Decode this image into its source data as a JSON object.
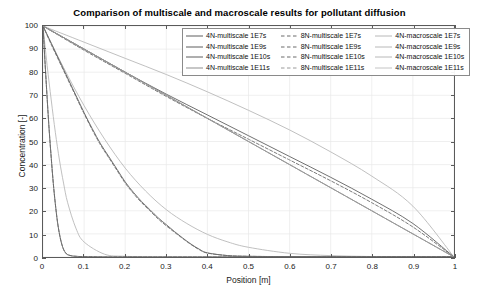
{
  "chart_data": {
    "type": "line",
    "title": "Comparison of multiscale and macroscale results for pollutant diffusion",
    "xlabel": "Position [m]",
    "ylabel": "Concentration [-]",
    "xlim": [
      0,
      1
    ],
    "ylim": [
      0,
      100
    ],
    "xticks": [
      "0",
      "0.1",
      "0.2",
      "0.3",
      "0.4",
      "0.5",
      "0.6",
      "0.7",
      "0.8",
      "0.9",
      "1"
    ],
    "xtick_values": [
      0,
      0.1,
      0.2,
      0.3,
      0.4,
      0.5,
      0.6,
      0.7,
      0.8,
      0.9,
      1
    ],
    "yticks": [
      "0",
      "10",
      "20",
      "30",
      "40",
      "50",
      "60",
      "70",
      "80",
      "90",
      "100"
    ],
    "ytick_values": [
      0,
      10,
      20,
      30,
      40,
      50,
      60,
      70,
      80,
      90,
      100
    ],
    "grid": true,
    "legend_position": "top-right",
    "legend_columns": 3,
    "series": [
      {
        "name": "4N-multiscale 1E7s",
        "style": "solid",
        "color": "#5f5f5f",
        "x": [
          0,
          0.005,
          0.01,
          0.015,
          0.02,
          0.025,
          0.03,
          0.035,
          0.04,
          0.045,
          0.05,
          0.055,
          0.06,
          0.07,
          0.08,
          0.1,
          0.15,
          0.2,
          0.3,
          0.4,
          0.5,
          0.6,
          0.7,
          0.8,
          0.9,
          1
        ],
        "values": [
          100,
          84,
          69,
          55,
          43,
          32,
          23,
          15.5,
          10,
          6,
          3.3,
          1.8,
          1.0,
          0.5,
          0.3,
          0.15,
          0.05,
          0.02,
          0.01,
          0.0,
          0.0,
          0.0,
          0.0,
          0.0,
          0.0,
          0.0
        ]
      },
      {
        "name": "8N-multiscale 1E7s",
        "style": "dashed",
        "color": "#6b6b6b",
        "x": [
          0,
          0.005,
          0.01,
          0.015,
          0.02,
          0.025,
          0.03,
          0.035,
          0.04,
          0.045,
          0.05,
          0.055,
          0.06,
          0.07,
          0.08,
          0.1,
          0.15,
          0.2,
          0.3,
          0.4,
          0.5,
          0.6,
          0.7,
          0.8,
          0.9,
          1
        ],
        "values": [
          100,
          84,
          69,
          55,
          43,
          32,
          23,
          15.5,
          10,
          6,
          3.3,
          1.8,
          1.0,
          0.5,
          0.3,
          0.15,
          0.05,
          0.02,
          0.01,
          0.0,
          0.0,
          0.0,
          0.0,
          0.0,
          0.0,
          0.0
        ]
      },
      {
        "name": "4N-macroscale 1E7s",
        "style": "solid",
        "color": "#b8b8b8",
        "x": [
          0,
          0.01,
          0.02,
          0.03,
          0.04,
          0.05,
          0.06,
          0.08,
          0.1,
          0.15,
          0.2,
          0.3,
          0.4,
          0.5,
          0.6,
          0.8,
          1
        ],
        "values": [
          100,
          83,
          68,
          54,
          42,
          32,
          23.5,
          12.5,
          6.5,
          1.2,
          0.3,
          0.02,
          0.0,
          0.0,
          0.0,
          0.0,
          0.0
        ]
      },
      {
        "name": "4N-multiscale 1E9s",
        "style": "solid",
        "color": "#5f5f5f",
        "x": [
          0,
          0.02,
          0.04,
          0.06,
          0.08,
          0.1,
          0.12,
          0.14,
          0.16,
          0.18,
          0.2,
          0.22,
          0.24,
          0.26,
          0.28,
          0.3,
          0.32,
          0.34,
          0.36,
          0.38,
          0.4,
          0.45,
          0.5,
          0.6,
          0.7,
          0.8,
          0.9,
          1
        ],
        "values": [
          100,
          92.5,
          85,
          77.5,
          70,
          62.5,
          55.5,
          49,
          43.5,
          38,
          32.5,
          28,
          24,
          20.5,
          17,
          14,
          11,
          8.2,
          5.6,
          3.4,
          1.8,
          0.6,
          0.3,
          0.15,
          0.08,
          0.04,
          0.02,
          0.0
        ]
      },
      {
        "name": "8N-multiscale 1E9s",
        "style": "dashed",
        "color": "#6b6b6b",
        "x": [
          0,
          0.02,
          0.04,
          0.06,
          0.08,
          0.1,
          0.12,
          0.14,
          0.16,
          0.18,
          0.2,
          0.22,
          0.24,
          0.26,
          0.28,
          0.3,
          0.32,
          0.34,
          0.36,
          0.38,
          0.4,
          0.45,
          0.5,
          0.6,
          0.7,
          0.8,
          0.9,
          1
        ],
        "values": [
          100,
          92,
          84.5,
          77,
          69.5,
          62,
          55,
          48.5,
          43,
          37.5,
          32,
          27.5,
          23.5,
          20,
          16.5,
          13.5,
          10.7,
          8.0,
          5.4,
          3.2,
          1.7,
          0.6,
          0.3,
          0.15,
          0.08,
          0.04,
          0.02,
          0.0
        ]
      },
      {
        "name": "4N-macroscale 1E9s",
        "style": "solid",
        "color": "#b8b8b8",
        "x": [
          0,
          0.05,
          0.1,
          0.15,
          0.2,
          0.25,
          0.3,
          0.35,
          0.4,
          0.45,
          0.5,
          0.6,
          0.7,
          0.8,
          0.9,
          1
        ],
        "values": [
          100,
          82,
          65.5,
          51,
          38.5,
          28.5,
          20.5,
          14.5,
          9.8,
          6.5,
          4.2,
          1.6,
          0.6,
          0.2,
          0.05,
          0.0
        ]
      },
      {
        "name": "4N-multiscale 1E10s",
        "style": "solid",
        "color": "#5f5f5f",
        "x": [
          0,
          0.1,
          0.2,
          0.3,
          0.4,
          0.5,
          0.6,
          0.7,
          0.8,
          0.9,
          1
        ],
        "values": [
          100,
          90,
          80,
          70.5,
          61.5,
          52.5,
          43.5,
          34.5,
          25,
          14.5,
          0
        ]
      },
      {
        "name": "8N-multiscale 1E10s",
        "style": "dashed",
        "color": "#6b6b6b",
        "x": [
          0,
          0.1,
          0.2,
          0.3,
          0.4,
          0.5,
          0.6,
          0.7,
          0.8,
          0.9,
          1
        ],
        "values": [
          100,
          89.5,
          79.5,
          69.5,
          60,
          51,
          42,
          33,
          23.5,
          13,
          0
        ]
      },
      {
        "name": "4N-macroscale 1E10s",
        "style": "solid",
        "color": "#b8b8b8",
        "x": [
          0,
          0.1,
          0.2,
          0.3,
          0.4,
          0.5,
          0.6,
          0.7,
          0.8,
          0.9,
          1
        ],
        "values": [
          100,
          93,
          86,
          79,
          71.5,
          63.5,
          55,
          45.5,
          35,
          22,
          0
        ]
      },
      {
        "name": "4N-multiscale 1E11s",
        "style": "solid",
        "color": "#8f8f8f",
        "x": [
          0,
          0.1,
          0.2,
          0.3,
          0.4,
          0.5,
          0.6,
          0.7,
          0.8,
          0.9,
          1
        ],
        "values": [
          100,
          90,
          80,
          70,
          60,
          50,
          40,
          30,
          20,
          10,
          0
        ]
      },
      {
        "name": "8N-multiscale 1E11s",
        "style": "dashed",
        "color": "#9a9a9a",
        "x": [
          0,
          0.1,
          0.2,
          0.3,
          0.4,
          0.5,
          0.6,
          0.7,
          0.8,
          0.9,
          1
        ],
        "values": [
          100,
          90,
          80,
          70,
          60,
          50,
          40,
          30,
          20,
          10,
          0
        ]
      },
      {
        "name": "4N-macroscale 1E11s",
        "style": "solid",
        "color": "#c4c4c4",
        "x": [
          0,
          0.1,
          0.2,
          0.3,
          0.4,
          0.5,
          0.6,
          0.7,
          0.8,
          0.9,
          1
        ],
        "values": [
          100,
          90,
          80,
          70,
          60,
          50,
          40,
          30,
          20,
          10,
          0
        ]
      }
    ]
  },
  "legend": {
    "rows": [
      [
        {
          "label": "4N-multiscale 1E7s",
          "style": "solid",
          "color": "#5f5f5f"
        },
        {
          "label": "8N-multiscale 1E7s",
          "style": "dashed",
          "color": "#6b6b6b"
        },
        {
          "label": "4N-macroscale 1E7s",
          "style": "solid",
          "color": "#b8b8b8"
        }
      ],
      [
        {
          "label": "4N-multiscale 1E9s",
          "style": "solid",
          "color": "#5f5f5f"
        },
        {
          "label": "8N-multiscale 1E9s",
          "style": "dashed",
          "color": "#6b6b6b"
        },
        {
          "label": "4N-macroscale 1E9s",
          "style": "solid",
          "color": "#b8b8b8"
        }
      ],
      [
        {
          "label": "4N-multiscale 1E10s",
          "style": "solid",
          "color": "#5f5f5f"
        },
        {
          "label": "8N-multiscale 1E10s",
          "style": "dashed",
          "color": "#6b6b6b"
        },
        {
          "label": "4N-macroscale 1E10s",
          "style": "solid",
          "color": "#b8b8b8"
        }
      ],
      [
        {
          "label": "4N-multiscale 1E11s",
          "style": "solid",
          "color": "#8f8f8f"
        },
        {
          "label": "8N-multiscale 1E11s",
          "style": "dashed",
          "color": "#9a9a9a"
        },
        {
          "label": "4N-macroscale 1E11s",
          "style": "solid",
          "color": "#c4c4c4"
        }
      ]
    ]
  },
  "style": {
    "axis_color": "#5a5a5a",
    "grid_color": "#e8e8e8",
    "text_color": "#1a1a1a",
    "background": "#ffffff"
  }
}
